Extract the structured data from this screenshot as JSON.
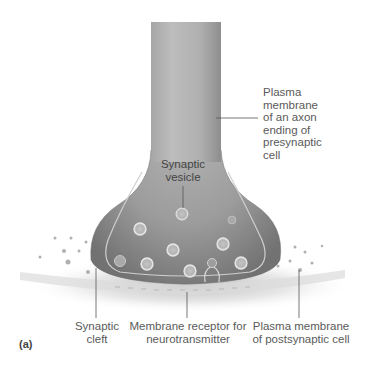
{
  "figure": {
    "panel_label": "(a)",
    "labels": {
      "presynaptic_membrane": [
        "Plasma",
        "membrane",
        "of an axon",
        "ending of",
        "presynaptic",
        "cell"
      ],
      "vesicle": [
        "Synaptic",
        "vesicle"
      ],
      "cleft": [
        "Synaptic",
        "cleft"
      ],
      "receptor": [
        "Membrane receptor for",
        "neurotransmitter"
      ],
      "postsynaptic_membrane": [
        "Plasma membrane",
        "of postsynaptic cell"
      ]
    },
    "colors": {
      "axon": "#9a9a9a",
      "axon_light": "#b8b8b8",
      "bulb_dark": "#7d7d7d",
      "membrane_line": "#c8c8c8",
      "vesicle": "#d2d2d2",
      "background": "#ffffff"
    }
  }
}
